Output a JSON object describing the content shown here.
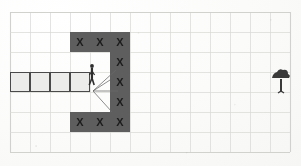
{
  "scene": {
    "title": "Grid maze worksheet",
    "background_color": "#fbfbfa",
    "paper_tint": "#fdfdfc"
  },
  "grid": {
    "name": "worksheet-grid",
    "columns": 14,
    "rows": 7,
    "cell_size": 20,
    "origin_x": 10,
    "origin_y": 12,
    "line_color": "#d9d9d6",
    "border_color": "#cfcfcb",
    "width": 280,
    "height": 140
  },
  "blocked_cells": {
    "name": "wall-cells",
    "label": "X",
    "fill_color": "#5e5e5e",
    "text_color": "#1c1c1c",
    "cells": [
      {
        "col": 3,
        "row": 1
      },
      {
        "col": 4,
        "row": 1
      },
      {
        "col": 5,
        "row": 1
      },
      {
        "col": 5,
        "row": 2
      },
      {
        "col": 5,
        "row": 3
      },
      {
        "col": 5,
        "row": 4
      },
      {
        "col": 3,
        "row": 5
      },
      {
        "col": 4,
        "row": 5
      },
      {
        "col": 5,
        "row": 5
      }
    ]
  },
  "corridor": {
    "name": "open-corridor",
    "fill_color": "#ececea",
    "stroke_color": "#4a4a4a",
    "row": 3,
    "start_col": 0,
    "end_col": 3,
    "cell_count": 4
  },
  "actor": {
    "name": "stick-figure",
    "label": "person",
    "color": "#2e2e2e",
    "col": 3,
    "row": 2,
    "x": 92,
    "y": 66
  },
  "vision_rays": {
    "name": "line-of-sight-rays",
    "color": "#6a6a6a",
    "origin_x": 93,
    "origin_y": 91,
    "count": 4,
    "endpoints": [
      {
        "x": 116,
        "y": 70
      },
      {
        "x": 110,
        "y": 80
      },
      {
        "x": 118,
        "y": 91
      },
      {
        "x": 112,
        "y": 112
      }
    ]
  },
  "goal": {
    "name": "tree-marker",
    "label": "tree",
    "color": "#3a3a3a",
    "col": 13,
    "row": 3,
    "x": 280,
    "y": 80
  },
  "colors": {
    "wall": "#5e5e5e",
    "corridor": "#ececea",
    "grid_line": "#d9d9d6",
    "ink": "#2e2e2e"
  }
}
